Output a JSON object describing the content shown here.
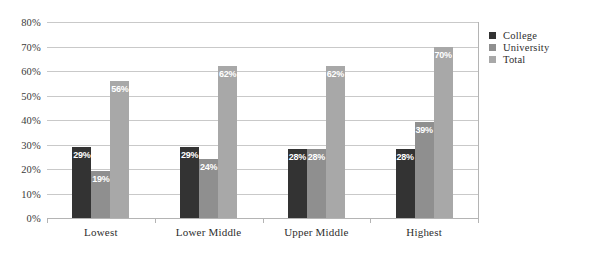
{
  "chart_data": {
    "type": "bar",
    "title": "",
    "subtitle": "",
    "xlabel": "",
    "ylabel": "",
    "categories": [
      "Lowest",
      "Lower Middle",
      "Upper Middle",
      "Highest"
    ],
    "series": [
      {
        "name": "College",
        "color": "#333333",
        "values": [
          29,
          29,
          28,
          28
        ],
        "labels": [
          "29%",
          "29%",
          "28%",
          "28%"
        ]
      },
      {
        "name": "University",
        "color": "#8f8f8f",
        "values": [
          19,
          24,
          28,
          39
        ],
        "labels": [
          "19%",
          "24%",
          "28%",
          "39%"
        ]
      },
      {
        "name": "Total",
        "color": "#a8a8a8",
        "values": [
          56,
          62,
          62,
          70
        ],
        "labels": [
          "56%",
          "62%",
          "62%",
          "70%"
        ]
      }
    ],
    "ylim": [
      0,
      80
    ],
    "ytick_step": 10,
    "ytick_labels": [
      "80%",
      "70%",
      "60%",
      "50%",
      "40%",
      "30%",
      "20%",
      "10%",
      "0%"
    ],
    "ytick_values": [
      80,
      70,
      60,
      50,
      40,
      30,
      20,
      10,
      0
    ],
    "grid": true,
    "grid_axis": "y",
    "legend_position": "right",
    "value_labels_inside_bars": true,
    "value_label_color": "#ffffff"
  },
  "legend": {
    "items": [
      {
        "label": "College",
        "swatch": "college"
      },
      {
        "label": "University",
        "swatch": "university"
      },
      {
        "label": "Total",
        "swatch": "total"
      }
    ]
  }
}
